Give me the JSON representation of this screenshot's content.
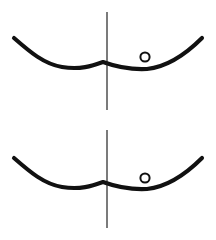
{
  "figure": {
    "background_color": "#ffffff",
    "stroke_color": "#111111",
    "axis_color": "#1a1a1a",
    "particle_fill": "#ffffff",
    "width": 216,
    "height": 240,
    "caption": ""
  },
  "panels": [
    {
      "id": "panel-top",
      "label": "",
      "curve": {
        "name": "double-well-potential-curve",
        "path": "M 14,38 C 30,52 44,64 62,67 C 80,70 92,66 103,62 C 114,66 128,70 147,69 C 166,67 186,54 202,38",
        "left_end": [
          14,
          38
        ],
        "right_end": [
          202,
          38
        ],
        "left_minimum": [
          62,
          67
        ],
        "central_maximum": [
          103,
          62
        ],
        "right_minimum": [
          147,
          69
        ]
      },
      "axis": {
        "name": "vertical-axis-line",
        "x": 107,
        "y_top": 12,
        "y_bottom": 110
      },
      "particle": {
        "name": "particle-circle",
        "cx": 145,
        "cy": 57,
        "r": 4.6,
        "label": ""
      }
    },
    {
      "id": "panel-bottom",
      "label": "",
      "curve": {
        "name": "double-well-potential-curve",
        "path": "M 14,38 C 30,52 44,64 62,67 C 80,70 92,66 103,62 C 114,66 128,70 147,69 C 166,67 186,54 202,38",
        "left_end": [
          14,
          38
        ],
        "right_end": [
          202,
          38
        ],
        "left_minimum": [
          62,
          67
        ],
        "central_maximum": [
          103,
          62
        ],
        "right_minimum": [
          147,
          69
        ]
      },
      "axis": {
        "name": "vertical-axis-line",
        "x": 107,
        "y_top": 10,
        "y_bottom": 108
      },
      "particle": {
        "name": "particle-circle",
        "cx": 145,
        "cy": 58,
        "r": 4.6,
        "label": ""
      }
    }
  ]
}
